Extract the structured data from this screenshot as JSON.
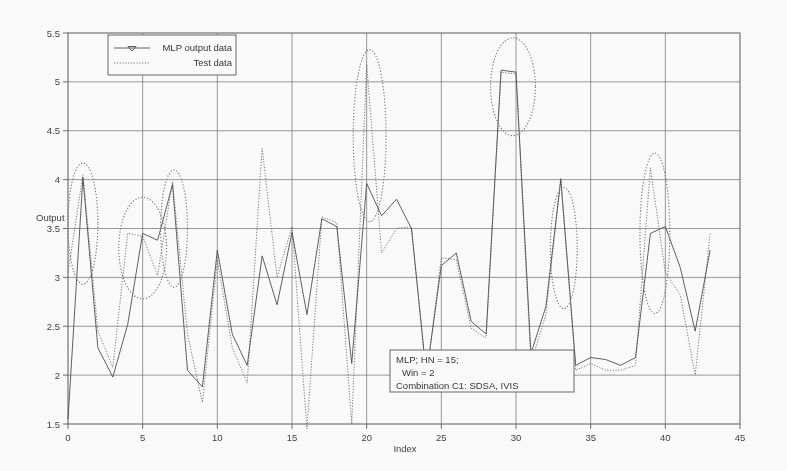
{
  "chart_data": {
    "type": "line",
    "title": "",
    "xlabel": "Index",
    "ylabel": "Output",
    "xlim": [
      0,
      45
    ],
    "ylim": [
      1.5,
      5.5
    ],
    "xticks": [
      0,
      5,
      10,
      15,
      20,
      25,
      30,
      35,
      40,
      45
    ],
    "xtick_labels": [
      "0",
      "5",
      "10",
      "15",
      "20",
      "25",
      "30",
      "35",
      "40",
      "45"
    ],
    "yticks": [
      1.5,
      2,
      2.5,
      3,
      3.5,
      4,
      4.5,
      5,
      5.5
    ],
    "ytick_labels": [
      "1.5",
      "2",
      "2.5",
      "3",
      "3.5",
      "4",
      "4.5",
      "5",
      "5.5"
    ],
    "grid": true,
    "legend_position": "top-left",
    "series": [
      {
        "name": "MLP output data",
        "style": "solid-line-with-triangle-marker",
        "color": "#4a4a4a",
        "x": [
          0,
          1,
          2,
          3,
          4,
          5,
          6,
          7,
          8,
          9,
          10,
          11,
          12,
          13,
          14,
          15,
          16,
          17,
          18,
          19,
          20,
          21,
          22,
          23,
          24,
          25,
          26,
          27,
          28,
          29,
          30,
          31,
          32,
          33,
          34,
          35,
          36,
          37,
          38,
          39,
          40,
          41,
          42,
          43
        ],
        "values": [
          1.55,
          4.02,
          2.28,
          1.98,
          2.52,
          3.45,
          3.38,
          3.95,
          2.05,
          1.88,
          3.28,
          2.42,
          2.1,
          3.22,
          2.72,
          3.46,
          2.62,
          3.6,
          3.52,
          2.12,
          3.96,
          3.63,
          3.8,
          3.5,
          2.0,
          3.12,
          3.25,
          2.55,
          2.42,
          5.12,
          5.1,
          2.22,
          2.7,
          4.0,
          2.1,
          2.18,
          2.16,
          2.1,
          2.18,
          3.45,
          3.52,
          3.1,
          2.45,
          3.28
        ]
      },
      {
        "name": "Test data",
        "style": "dotted-line",
        "color": "#666666",
        "x": [
          0,
          1,
          2,
          3,
          4,
          5,
          6,
          7,
          8,
          9,
          10,
          11,
          12,
          13,
          14,
          15,
          16,
          17,
          18,
          19,
          20,
          21,
          22,
          23,
          24,
          25,
          26,
          27,
          28,
          29,
          30,
          31,
          32,
          33,
          34,
          35,
          36,
          37,
          38,
          39,
          40,
          41,
          42,
          43
        ],
        "values": [
          3.05,
          4.05,
          2.45,
          2.08,
          3.45,
          3.42,
          3.02,
          3.98,
          2.42,
          1.72,
          3.18,
          2.28,
          1.92,
          4.32,
          3.0,
          3.52,
          1.45,
          3.62,
          3.56,
          1.5,
          5.18,
          3.25,
          3.5,
          3.52,
          1.98,
          3.2,
          3.18,
          2.48,
          2.38,
          5.1,
          5.08,
          2.12,
          2.62,
          4.02,
          2.05,
          2.12,
          2.05,
          2.05,
          2.1,
          4.12,
          3.05,
          2.82,
          2.0,
          3.45
        ]
      }
    ],
    "annotations": {
      "ellipses": [
        {
          "cx": 1.0,
          "cy": 3.55,
          "rx": 1.0,
          "ry": 0.62
        },
        {
          "cx": 5.0,
          "cy": 3.3,
          "rx": 1.6,
          "ry": 0.52
        },
        {
          "cx": 7.1,
          "cy": 3.5,
          "rx": 0.9,
          "ry": 0.6
        },
        {
          "cx": 20.2,
          "cy": 4.45,
          "rx": 1.1,
          "ry": 0.88
        },
        {
          "cx": 29.8,
          "cy": 4.95,
          "rx": 1.5,
          "ry": 0.5
        },
        {
          "cx": 33.2,
          "cy": 3.3,
          "rx": 0.9,
          "ry": 0.62
        },
        {
          "cx": 39.3,
          "cy": 3.45,
          "rx": 1.0,
          "ry": 0.82
        }
      ]
    },
    "text_box": {
      "lines": [
        "MLP; HN = 15;",
        "Win = 2",
        "Combination C1: SDSA, IVIS"
      ]
    }
  },
  "legend": {
    "items": [
      {
        "label": "MLP output data",
        "marker": "line-triangle-marker"
      },
      {
        "label": "Test data",
        "marker": "dotted-line"
      }
    ]
  },
  "axes": {
    "x_title": "Index",
    "y_title": "Output"
  }
}
